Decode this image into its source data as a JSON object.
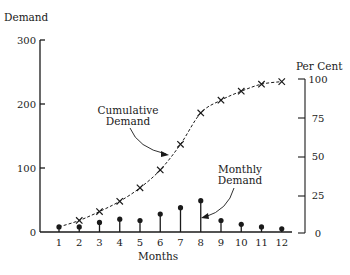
{
  "chart_data": {
    "type": "line",
    "title": "",
    "xlabel": "Months",
    "ylabel": "Demand",
    "y2label": "Per Cent",
    "x": [
      1,
      2,
      3,
      4,
      5,
      6,
      7,
      8,
      9,
      10,
      11,
      12
    ],
    "xticks": [
      "1",
      "2",
      "3",
      "4",
      "5",
      "6",
      "7",
      "8",
      "9",
      "10",
      "11",
      "12"
    ],
    "yticks": [
      "0",
      "100",
      "200",
      "300"
    ],
    "y2ticks": [
      "0",
      "25",
      "50",
      "75",
      "100"
    ],
    "ylim": [
      0,
      300
    ],
    "y2lim": [
      0,
      100
    ],
    "grid": false,
    "legend": "none",
    "series": [
      {
        "name": "Cumulative Demand",
        "style": "dashed line with x markers",
        "values": [
          8,
          18,
          32,
          48,
          69,
          97,
          137,
          186,
          206,
          220,
          231,
          235
        ]
      },
      {
        "name": "Monthly Demand",
        "style": "stem with dot markers",
        "values": [
          8,
          8,
          15,
          20,
          18,
          28,
          38,
          49,
          18,
          12,
          8,
          5
        ]
      }
    ],
    "annotations": [
      {
        "text": "Cumulative Demand",
        "points_to": "Cumulative Demand curve near month 6.5"
      },
      {
        "text": "Monthly Demand",
        "points_to": "Monthly Demand stem at month 8"
      }
    ]
  },
  "labels": {
    "ylabel": "Demand",
    "y2label": "Per Cent",
    "xlabel": "Months",
    "cumulative_line1": "Cumulative",
    "cumulative_line2": "Demand",
    "monthly_line1": "Monthly",
    "monthly_line2": "Demand"
  }
}
